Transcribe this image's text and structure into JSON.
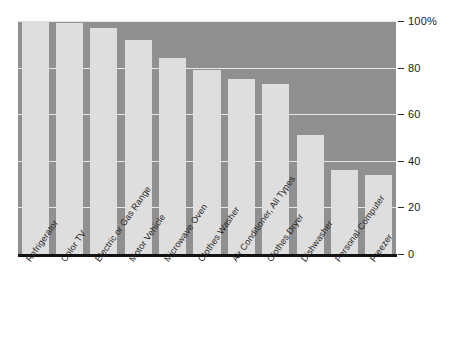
{
  "chart_data": {
    "type": "bar",
    "title": "",
    "subtitle": "",
    "xlabel": "",
    "ylabel": "",
    "ylim": [
      0,
      100
    ],
    "grid": true,
    "legend": null,
    "y_unit": "%",
    "categories": [
      "Refrigerator",
      "Color TV",
      "Electric or Gas Range",
      "Motor Vehicle",
      "Microwave Oven",
      "Clothes Washer",
      "Air Conditioner, All Types",
      "Clothes Dryer",
      "Dishwasher",
      "Personal Computer",
      "Freezer"
    ],
    "values": [
      100,
      99,
      97,
      92,
      84,
      79,
      75,
      73,
      51,
      36,
      34
    ],
    "y_ticks": [
      {
        "value": 100,
        "label": "100%"
      },
      {
        "value": 80,
        "label": "80"
      },
      {
        "value": 60,
        "label": "60"
      },
      {
        "value": 40,
        "label": "40"
      },
      {
        "value": 20,
        "label": "20"
      },
      {
        "value": 0,
        "label": "0"
      }
    ],
    "colors": {
      "plot_background": "#909090",
      "bar_fill": "#dedede",
      "gridline": "#e6e6e6",
      "axis_line": "#121212",
      "text": "#1c1c1c",
      "page_background": "#ffffff"
    }
  }
}
